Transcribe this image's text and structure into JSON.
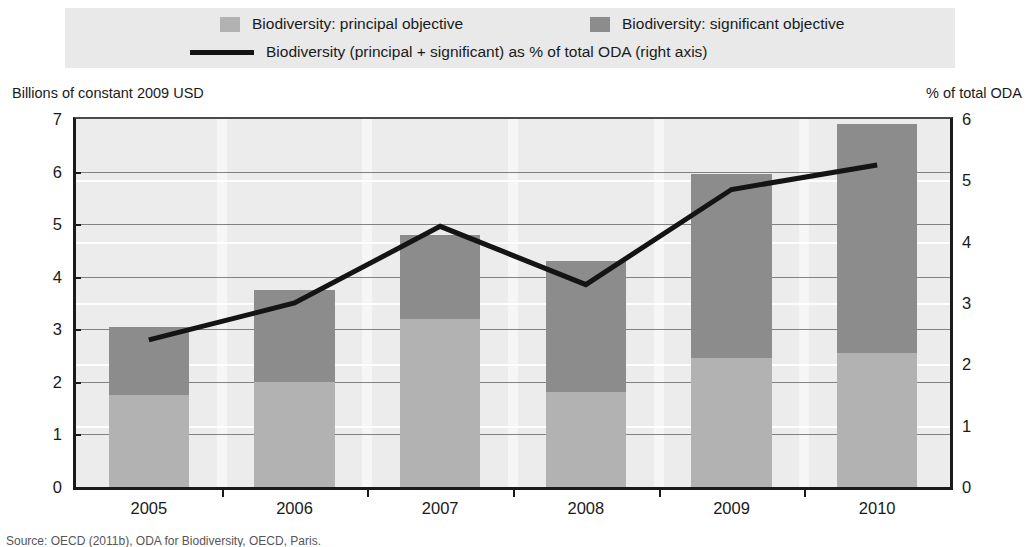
{
  "legend": {
    "items": [
      {
        "label": "Biodiversity: principal objective",
        "swatch": "square-swatch-principal",
        "color": "#b2b2b2"
      },
      {
        "label": "Biodiversity: significant objective",
        "swatch": "square-swatch-significant",
        "color": "#8c8c8c"
      },
      {
        "label": "Biodiversity (principal + significant) as % of total ODA (right axis)",
        "swatch": "line-swatch",
        "color": "#141414"
      }
    ],
    "background": "#e9e9e9"
  },
  "axes": {
    "left_caption": "Billions of constant 2009 USD",
    "right_caption": "% of total ODA",
    "left_ticks": [
      "7",
      "6",
      "5",
      "4",
      "3",
      "2",
      "1",
      "0"
    ],
    "right_ticks": [
      "6",
      "5",
      "4",
      "3",
      "2",
      "1",
      "0"
    ]
  },
  "source": {
    "text": "Source: OECD (2011b), ODA for Biodiversity, OECD, Paris."
  },
  "chart_data": {
    "type": "bar",
    "title": "",
    "subtitle": "",
    "xlabel": "",
    "ylabel": "Billions of constant 2009 USD",
    "y2label": "% of total ODA",
    "categories": [
      "2005",
      "2006",
      "2007",
      "2008",
      "2009",
      "2010"
    ],
    "ylim": [
      0,
      7
    ],
    "y2lim": [
      0,
      6
    ],
    "ytick_step": 1,
    "y2tick_step": 1,
    "grid": true,
    "legend_position": "top",
    "stacked": true,
    "series": [
      {
        "name": "Biodiversity: principal objective",
        "color": "#b2b2b2",
        "axis": "left",
        "values": [
          1.75,
          2.0,
          3.2,
          1.8,
          2.45,
          2.55
        ]
      },
      {
        "name": "Biodiversity: significant objective",
        "color": "#8c8c8c",
        "axis": "left",
        "values": [
          1.3,
          1.75,
          1.6,
          2.5,
          3.5,
          4.35
        ]
      },
      {
        "name": "Biodiversity (principal + significant) as % of total ODA (right axis)",
        "color": "#141414",
        "axis": "right",
        "type": "line",
        "values": [
          2.4,
          3.0,
          4.25,
          3.3,
          4.85,
          5.25
        ]
      }
    ],
    "totals": [
      3.05,
      3.75,
      4.8,
      4.3,
      5.95,
      6.9
    ]
  }
}
